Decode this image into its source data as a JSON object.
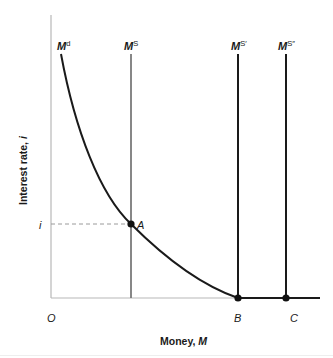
{
  "diagram": {
    "x_axis": {
      "label_prefix": "Money, ",
      "label_var": "M",
      "origin_label": "O",
      "ticks": [
        {
          "label": "B",
          "x": 238
        },
        {
          "label": "C",
          "x": 290
        }
      ]
    },
    "y_axis": {
      "label_prefix": "Interest rate, ",
      "label_var": "i",
      "ticks": [
        {
          "label": "i",
          "y": 224
        }
      ]
    },
    "curves": {
      "money_demand": {
        "base": "M",
        "sup": "d"
      },
      "money_supply": {
        "base": "M",
        "sup": "S"
      },
      "money_supply_prime": {
        "base": "M",
        "sup": "S′"
      },
      "money_supply_double_prime": {
        "base": "M",
        "sup": "S″"
      }
    },
    "points": [
      {
        "label": "A",
        "x": 131,
        "y": 224
      },
      {
        "label": "B",
        "x": 238,
        "y": 298
      },
      {
        "label": "C",
        "x": 286,
        "y": 298
      }
    ],
    "colors": {
      "axis": "#b0b0b0",
      "curve": "#1a1a1a",
      "ms_line": "#7a7a7a",
      "ms_shift_lines": "#1a1a1a",
      "dashed": "#9a9a9a"
    }
  }
}
